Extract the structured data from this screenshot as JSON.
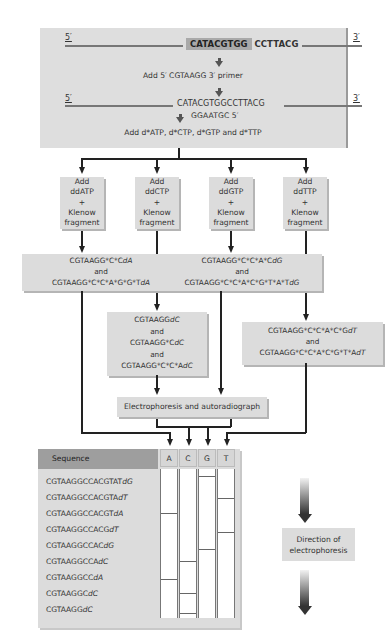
{
  "template": {
    "five_prime": "5′",
    "three_prime": "3′",
    "highlight_seq": "CATACGTGG",
    "rest_seq": "CCTTACG"
  },
  "steps": {
    "add_primer": "Add 5′ CGTAAGG 3′ primer",
    "annealed_template": "CATACGTGGCCTTACG",
    "primer": "GGAATGC  5′",
    "add_dntps": "Add d*ATP, d*CTP, d*GTP and d*TTP"
  },
  "reactions": [
    {
      "lane": "A",
      "line1": "Add",
      "line2": "ddATP",
      "line3": "+",
      "line4": "Klenow",
      "line5": "fragment"
    },
    {
      "lane": "C",
      "line1": "Add",
      "line2": "ddCTP",
      "line3": "+",
      "line4": "Klenow",
      "line5": "fragment"
    },
    {
      "lane": "G",
      "line1": "Add",
      "line2": "ddGTP",
      "line3": "+",
      "line4": "Klenow",
      "line5": "fragment"
    },
    {
      "lane": "T",
      "line1": "Add",
      "line2": "ddTTP",
      "line3": "+",
      "line4": "Klenow",
      "line5": "fragment"
    }
  ],
  "products": {
    "A": {
      "p1_base": "CGTAAGG*C*C",
      "p1_term": "dA",
      "and": "and",
      "p2_base": "CGTAAGG*C*C*A*G*G*T",
      "p2_term": "dA"
    },
    "C": {
      "p1_base": "CGTAAGG",
      "p1_term": "dC",
      "and1": "and",
      "p2_base": "CGTAAGG*C",
      "p2_term": "dC",
      "and2": "and",
      "p3_base": "CGTAAGG*C*C*A",
      "p3_term": "dC"
    },
    "G": {
      "p1_base": "CGTAAGG*C*C*A*C",
      "p1_term": "dG",
      "and": "and",
      "p2_base": "CGTAAGG*C*C*A*C*G*T*A*T",
      "p2_term": "dG"
    },
    "T": {
      "p1_base": "CGTAAGG*C*C*A*C*G",
      "p1_term": "dT",
      "and": "and",
      "p2_base": "CGTAAGG*C*C*A*C*G*T*A",
      "p2_term": "dT"
    }
  },
  "electrophoresis_label": "Electrophoresis and autoradiograph",
  "gel": {
    "header": "Sequence",
    "lanes": [
      "A",
      "C",
      "G",
      "T"
    ],
    "rows": [
      {
        "base": "CGTAAGGCCACGTAT",
        "term": "dG",
        "lane": "G"
      },
      {
        "base": "CGTAAGGCCACGTA",
        "term": "dT",
        "lane": "T"
      },
      {
        "base": "CGTAAGGCCACGT",
        "term": "dA",
        "lane": "A"
      },
      {
        "base": "CGTAAGGCCACG",
        "term": "dT",
        "lane": "T"
      },
      {
        "base": "CGTAAGGCCAC",
        "term": "dG",
        "lane": "G"
      },
      {
        "base": "CGTAAGGCCA",
        "term": "dC",
        "lane": "C"
      },
      {
        "base": "CGTAAGGCC",
        "term": "dA",
        "lane": "A"
      },
      {
        "base": "CGTAAGGC",
        "term": "dC",
        "lane": "C"
      },
      {
        "base": "CGTAAGG",
        "term": "dC",
        "lane": "C"
      }
    ]
  },
  "direction": {
    "line1": "Direction of",
    "line2": "electrophoresis"
  }
}
